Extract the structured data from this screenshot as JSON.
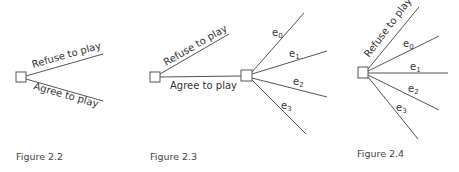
{
  "figures": [
    {
      "caption": "Figure 2.2",
      "branches": [
        "Refuse to play",
        "Agree to play"
      ]
    },
    {
      "caption": "Figure 2.3",
      "branches": [
        "Refuse to play",
        "Agree to play"
      ],
      "sub_branches": [
        {
          "base": "e",
          "sub": "0"
        },
        {
          "base": "e",
          "sub": "1"
        },
        {
          "base": "e",
          "sub": "2"
        },
        {
          "base": "e",
          "sub": "3"
        }
      ]
    },
    {
      "caption": "Figure 2.4",
      "branches": [
        "Refuse to play"
      ],
      "sub_branches": [
        {
          "base": "e",
          "sub": "0"
        },
        {
          "base": "e",
          "sub": "1"
        },
        {
          "base": "e",
          "sub": "2"
        },
        {
          "base": "e",
          "sub": "3"
        }
      ]
    }
  ]
}
